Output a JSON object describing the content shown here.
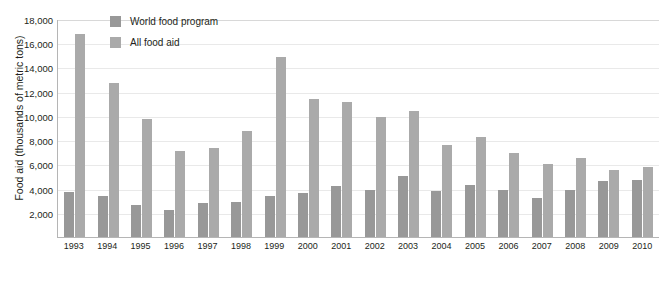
{
  "chart_data": {
    "type": "bar",
    "title": "",
    "xlabel": "",
    "ylabel": "Food aid (thousands of metric tons)",
    "ylim": [
      0,
      18000
    ],
    "yticks": [
      "18,000",
      "16,000",
      "14,000",
      "12,000",
      "10,000",
      "8,000",
      "6,000",
      "4,000",
      "2,000"
    ],
    "ytick_values": [
      18000,
      16000,
      14000,
      12000,
      10000,
      8000,
      6000,
      4000,
      2000
    ],
    "grid": true,
    "legend_position": "top-left",
    "categories": [
      "1993",
      "1994",
      "1995",
      "1996",
      "1997",
      "1998",
      "1999",
      "2000",
      "2001",
      "2002",
      "2003",
      "2004",
      "2005",
      "2006",
      "2007",
      "2008",
      "2009",
      "2010"
    ],
    "series": [
      {
        "name": "World food program",
        "color": "#989898",
        "values": [
          3700,
          3350,
          2650,
          2250,
          2800,
          2900,
          3400,
          3650,
          4250,
          3900,
          5050,
          3800,
          4300,
          3900,
          3250,
          3900,
          4650,
          4700
        ]
      },
      {
        "name": "All food aid",
        "color": "#aaaaaa",
        "values": [
          16800,
          12700,
          9750,
          7100,
          7350,
          8750,
          14850,
          11400,
          11150,
          9900,
          10400,
          7600,
          8250,
          6950,
          6050,
          6500,
          5550,
          5750
        ]
      }
    ]
  }
}
